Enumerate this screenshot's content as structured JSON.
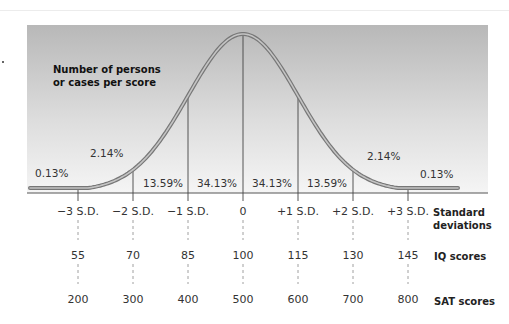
{
  "chart_data": {
    "type": "line",
    "title": "",
    "ylabel": "Number of persons or cases per score",
    "xlabel": "Standard deviations",
    "distribution": "normal",
    "x": [
      -3,
      -2,
      -1,
      0,
      1,
      2,
      3
    ],
    "sd_labels": [
      "−3 S.D.",
      "−2 S.D.",
      "−1 S.D.",
      "0",
      "+1 S.D.",
      "+2 S.D.",
      "+3 S.D."
    ],
    "segment_percentages": [
      {
        "region": "below -3 SD",
        "label": "0.13%",
        "value": 0.13
      },
      {
        "region": "-3 to -2 SD",
        "label": "2.14%",
        "value": 2.14
      },
      {
        "region": "-2 to -1 SD",
        "label": "13.59%",
        "value": 13.59
      },
      {
        "region": "-1 to 0 SD",
        "label": "34.13%",
        "value": 34.13
      },
      {
        "region": "0 to +1 SD",
        "label": "34.13%",
        "value": 34.13
      },
      {
        "region": "+1 to +2 SD",
        "label": "13.59%",
        "value": 13.59
      },
      {
        "region": "+2 to +3 SD",
        "label": "2.14%",
        "value": 2.14
      },
      {
        "region": "above +3 SD",
        "label": "0.13%",
        "value": 0.13
      }
    ],
    "scales": [
      {
        "name": "Standard deviations",
        "values": [
          "−3 S.D.",
          "−2 S.D.",
          "−1 S.D.",
          "0",
          "+1 S.D.",
          "+2 S.D.",
          "+3 S.D."
        ]
      },
      {
        "name": "IQ scores",
        "values": [
          55,
          70,
          85,
          100,
          115,
          130,
          145
        ]
      },
      {
        "name": "SAT scores",
        "values": [
          200,
          300,
          400,
          500,
          600,
          700,
          800
        ]
      }
    ],
    "grid": false,
    "legend": "none"
  },
  "labels": {
    "ylabel_line1": "Number of persons",
    "ylabel_line2": "or cases per score",
    "sd_row_title_line1": "Standard",
    "sd_row_title_line2": "deviations",
    "iq_row_title": "IQ scores",
    "sat_row_title": "SAT scores"
  },
  "pct": [
    "0.13%",
    "2.14%",
    "13.59%",
    "34.13%",
    "34.13%",
    "13.59%",
    "2.14%",
    "0.13%"
  ],
  "sd": [
    "−3 S.D.",
    "−2 S.D.",
    "−1 S.D.",
    "0",
    "+1 S.D.",
    "+2 S.D.",
    "+3 S.D."
  ],
  "iq": [
    "55",
    "70",
    "85",
    "100",
    "115",
    "130",
    "145"
  ],
  "sat": [
    "200",
    "300",
    "400",
    "500",
    "600",
    "700",
    "800"
  ],
  "colors": {
    "panel_top": "#b9b9b9",
    "panel_bottom": "#f4f4f4",
    "curve_outer": "#7a7a7a",
    "curve_inner": "#bdbdbd",
    "lines": "#444444"
  }
}
